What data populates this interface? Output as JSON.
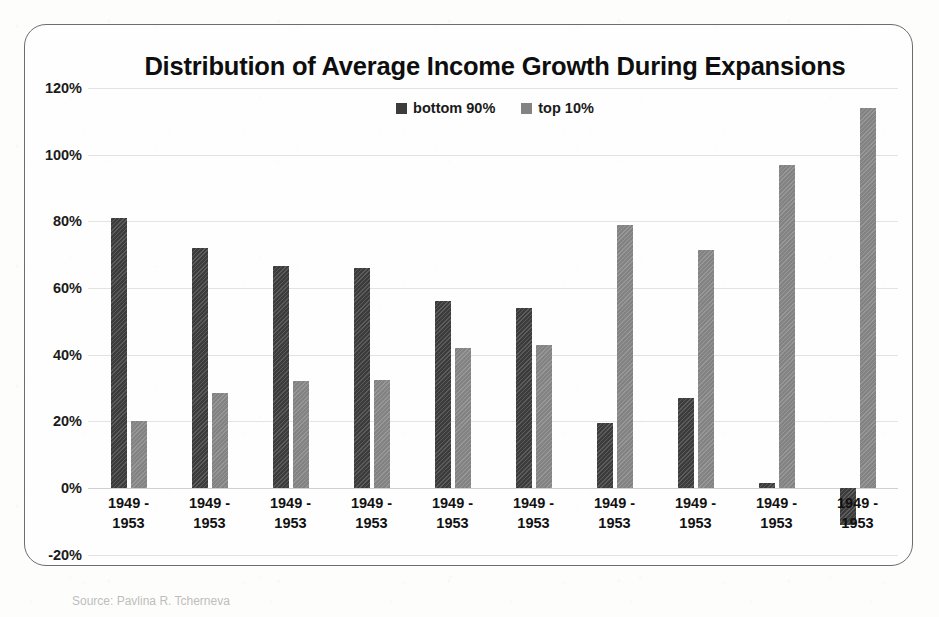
{
  "chart_data": {
    "type": "bar",
    "title": "Distribution of Average Income Growth During Expansions",
    "xlabel": "",
    "ylabel": "",
    "ylim": [
      -20,
      120
    ],
    "ytick_labels": [
      "120%",
      "100%",
      "80%",
      "60%",
      "40%",
      "20%",
      "0%",
      "-20%"
    ],
    "ytick_values": [
      120,
      100,
      80,
      60,
      40,
      20,
      0,
      -20
    ],
    "grid": true,
    "legend_position": "top-center",
    "categories": [
      "1949 -\n1953",
      "1949 -\n1953",
      "1949 -\n1953",
      "1949 -\n1953",
      "1949 -\n1953",
      "1949 -\n1953",
      "1949 -\n1953",
      "1949 -\n1953",
      "1949 -\n1953",
      "1949 -\n1953"
    ],
    "series": [
      {
        "name": "bottom 90%",
        "color": "#3c3c3c",
        "values": [
          81,
          72,
          66.5,
          66,
          56,
          54,
          19.5,
          27,
          1.5,
          -11
        ]
      },
      {
        "name": "top 10%",
        "color": "#838383",
        "values": [
          20,
          28.5,
          32,
          32.5,
          42,
          43,
          79,
          71.5,
          97,
          114
        ]
      }
    ]
  },
  "caption": {
    "text": "Source: Pavlina R. Tcherneva"
  }
}
